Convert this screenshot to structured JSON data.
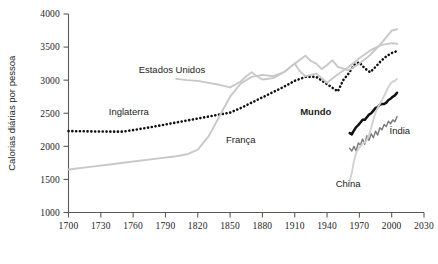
{
  "chart_data": {
    "type": "line",
    "title": "",
    "xlabel": "",
    "ylabel": "Calorias diárias por pessoa",
    "xlim": [
      1700,
      2030
    ],
    "ylim": [
      1000,
      4000
    ],
    "xticks": [
      1700,
      1730,
      1760,
      1790,
      1820,
      1850,
      1880,
      1910,
      1940,
      1970,
      2000,
      2030
    ],
    "yticks": [
      1000,
      1500,
      2000,
      2500,
      3000,
      3500,
      4000
    ],
    "grid": false,
    "legend": "inline-labels",
    "series": [
      {
        "name": "Inglaterra",
        "style": "dotted",
        "color": "#111111",
        "label_x": 1756,
        "label_y": 2480,
        "points": [
          [
            1700,
            2230
          ],
          [
            1710,
            2228
          ],
          [
            1720,
            2226
          ],
          [
            1730,
            2224
          ],
          [
            1740,
            2222
          ],
          [
            1750,
            2222
          ],
          [
            1760,
            2245
          ],
          [
            1770,
            2272
          ],
          [
            1780,
            2300
          ],
          [
            1790,
            2330
          ],
          [
            1800,
            2360
          ],
          [
            1810,
            2390
          ],
          [
            1820,
            2420
          ],
          [
            1830,
            2450
          ],
          [
            1840,
            2480
          ],
          [
            1850,
            2510
          ],
          [
            1860,
            2580
          ],
          [
            1870,
            2660
          ],
          [
            1880,
            2740
          ],
          [
            1890,
            2820
          ],
          [
            1900,
            2900
          ],
          [
            1910,
            2990
          ],
          [
            1920,
            3050
          ],
          [
            1930,
            3050
          ],
          [
            1940,
            2940
          ],
          [
            1950,
            2830
          ],
          [
            1955,
            3000
          ],
          [
            1960,
            3100
          ],
          [
            1965,
            3230
          ],
          [
            1970,
            3270
          ],
          [
            1975,
            3180
          ],
          [
            1980,
            3120
          ],
          [
            1985,
            3200
          ],
          [
            1990,
            3290
          ],
          [
            1995,
            3360
          ],
          [
            2000,
            3410
          ],
          [
            2005,
            3440
          ]
        ]
      },
      {
        "name": "França",
        "style": "solid",
        "color": "#c8c8c8",
        "label_x": 1860,
        "label_y": 2050,
        "points": [
          [
            1700,
            1650
          ],
          [
            1720,
            1690
          ],
          [
            1740,
            1730
          ],
          [
            1760,
            1770
          ],
          [
            1780,
            1810
          ],
          [
            1800,
            1850
          ],
          [
            1810,
            1880
          ],
          [
            1820,
            1950
          ],
          [
            1830,
            2150
          ],
          [
            1840,
            2450
          ],
          [
            1850,
            2750
          ],
          [
            1860,
            2950
          ],
          [
            1870,
            3050
          ],
          [
            1880,
            3080
          ],
          [
            1890,
            3060
          ],
          [
            1900,
            3120
          ],
          [
            1910,
            3250
          ],
          [
            1915,
            3130
          ],
          [
            1920,
            3060
          ],
          [
            1930,
            3100
          ],
          [
            1940,
            2960
          ],
          [
            1950,
            3090
          ],
          [
            1960,
            3200
          ],
          [
            1970,
            3330
          ],
          [
            1980,
            3450
          ],
          [
            1990,
            3530
          ],
          [
            2000,
            3560
          ],
          [
            2005,
            3550
          ]
        ]
      },
      {
        "name": "Estados Unidos",
        "style": "solid",
        "color": "#c8c8c8",
        "label_x": 1796,
        "label_y": 3110,
        "points": [
          [
            1800,
            3020
          ],
          [
            1810,
            3000
          ],
          [
            1820,
            2990
          ],
          [
            1830,
            2960
          ],
          [
            1840,
            2930
          ],
          [
            1850,
            2890
          ],
          [
            1860,
            2980
          ],
          [
            1865,
            3060
          ],
          [
            1870,
            3120
          ],
          [
            1875,
            3060
          ],
          [
            1880,
            3010
          ],
          [
            1890,
            3030
          ],
          [
            1900,
            3120
          ],
          [
            1910,
            3250
          ],
          [
            1920,
            3370
          ],
          [
            1925,
            3290
          ],
          [
            1930,
            3250
          ],
          [
            1935,
            3170
          ],
          [
            1940,
            3230
          ],
          [
            1945,
            3300
          ],
          [
            1950,
            3200
          ],
          [
            1960,
            3150
          ],
          [
            1970,
            3250
          ],
          [
            1980,
            3380
          ],
          [
            1990,
            3550
          ],
          [
            2000,
            3750
          ],
          [
            2005,
            3770
          ]
        ]
      },
      {
        "name": "Mundo",
        "style": "solid-bold",
        "color": "#111111",
        "label_x": 1944,
        "label_y": 2470,
        "points": [
          [
            1961,
            2200
          ],
          [
            1963,
            2180
          ],
          [
            1965,
            2240
          ],
          [
            1967,
            2290
          ],
          [
            1969,
            2320
          ],
          [
            1971,
            2360
          ],
          [
            1973,
            2400
          ],
          [
            1975,
            2400
          ],
          [
            1977,
            2440
          ],
          [
            1979,
            2480
          ],
          [
            1981,
            2500
          ],
          [
            1983,
            2540
          ],
          [
            1985,
            2580
          ],
          [
            1987,
            2590
          ],
          [
            1989,
            2630
          ],
          [
            1991,
            2640
          ],
          [
            1993,
            2640
          ],
          [
            1995,
            2660
          ],
          [
            1997,
            2700
          ],
          [
            1999,
            2720
          ],
          [
            2001,
            2750
          ],
          [
            2003,
            2770
          ],
          [
            2005,
            2810
          ]
        ]
      },
      {
        "name": "Índia",
        "style": "solid-jagged",
        "color": "#7a7a7a",
        "label_x": 1998,
        "label_y": 2180,
        "points": [
          [
            1961,
            1970
          ],
          [
            1963,
            1930
          ],
          [
            1965,
            2000
          ],
          [
            1967,
            1930
          ],
          [
            1969,
            2050
          ],
          [
            1971,
            2020
          ],
          [
            1973,
            2110
          ],
          [
            1975,
            2030
          ],
          [
            1977,
            2160
          ],
          [
            1979,
            2090
          ],
          [
            1981,
            2190
          ],
          [
            1983,
            2130
          ],
          [
            1985,
            2230
          ],
          [
            1987,
            2170
          ],
          [
            1989,
            2280
          ],
          [
            1991,
            2250
          ],
          [
            1993,
            2330
          ],
          [
            1995,
            2300
          ],
          [
            1997,
            2380
          ],
          [
            1999,
            2340
          ],
          [
            2001,
            2400
          ],
          [
            2003,
            2370
          ],
          [
            2005,
            2450
          ]
        ]
      },
      {
        "name": "China",
        "style": "solid",
        "color": "#d2d2d2",
        "label_x": 1948,
        "label_y": 1390,
        "points": [
          [
            1961,
            1470
          ],
          [
            1963,
            1600
          ],
          [
            1965,
            1780
          ],
          [
            1967,
            1900
          ],
          [
            1969,
            1960
          ],
          [
            1971,
            2000
          ],
          [
            1973,
            2040
          ],
          [
            1975,
            2060
          ],
          [
            1977,
            2090
          ],
          [
            1979,
            2180
          ],
          [
            1981,
            2280
          ],
          [
            1983,
            2400
          ],
          [
            1985,
            2510
          ],
          [
            1987,
            2580
          ],
          [
            1989,
            2640
          ],
          [
            1991,
            2700
          ],
          [
            1993,
            2760
          ],
          [
            1995,
            2830
          ],
          [
            1997,
            2900
          ],
          [
            1999,
            2950
          ],
          [
            2001,
            2980
          ],
          [
            2003,
            2990
          ],
          [
            2005,
            3020
          ]
        ]
      }
    ]
  },
  "axis": {
    "y_title": "Calorias diárias por pessoa"
  }
}
